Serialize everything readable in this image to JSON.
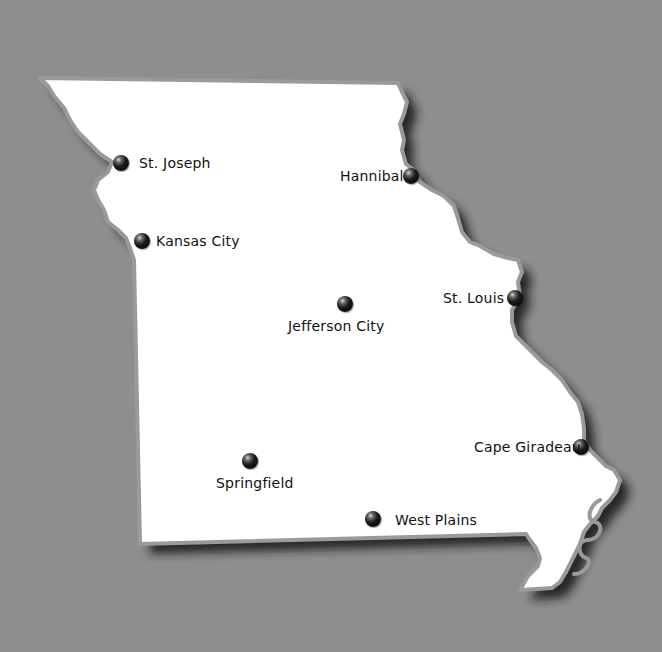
{
  "map": {
    "region": "Missouri",
    "background_color": "#8e8e8e",
    "land_color": "#ffffff",
    "border_color": "#9a9a9a",
    "shadow_color": "#1a1a1a",
    "cities": [
      {
        "name": "St. Joseph",
        "dot": [
          121,
          163
        ],
        "label": [
          139,
          155
        ]
      },
      {
        "name": "Kansas City",
        "dot": [
          142,
          241
        ],
        "label": [
          156,
          233
        ]
      },
      {
        "name": "Hannibal",
        "dot": [
          411,
          176
        ],
        "label": [
          340,
          168
        ]
      },
      {
        "name": "St. Louis",
        "dot": [
          515,
          298
        ],
        "label": [
          443,
          290
        ]
      },
      {
        "name": "Jefferson City",
        "dot": [
          345,
          304
        ],
        "label": [
          288,
          318
        ]
      },
      {
        "name": "Cape Giradeau",
        "dot": [
          581,
          447
        ],
        "label": [
          474,
          439
        ]
      },
      {
        "name": "Springfield",
        "dot": [
          250,
          461
        ],
        "label": [
          216,
          475
        ]
      },
      {
        "name": "West Plains",
        "dot": [
          373,
          519
        ],
        "label": [
          395,
          512
        ]
      }
    ]
  }
}
